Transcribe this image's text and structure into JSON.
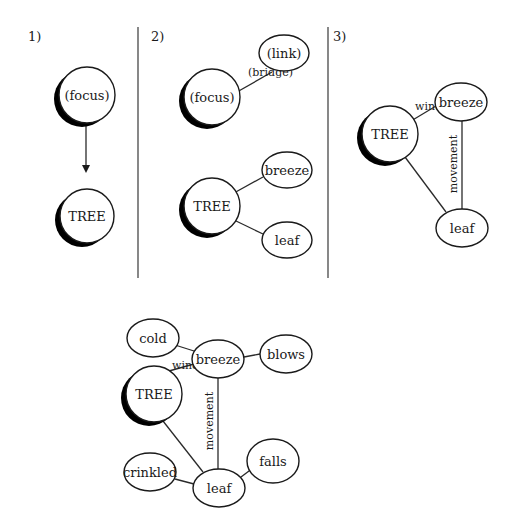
{
  "colors": {
    "background": "#ffffff",
    "stroke": "#1a1a1a",
    "shadow": "#000000",
    "divider": "#555555"
  },
  "panels": [
    {
      "id": "panel-1",
      "label": "1)",
      "x": 28,
      "y": 41
    },
    {
      "id": "panel-2",
      "label": "2)",
      "x": 151,
      "y": 41
    },
    {
      "id": "panel-3",
      "label": "3)",
      "x": 333,
      "y": 41
    }
  ],
  "dividers": [
    {
      "id": "divider-1",
      "x1": 138,
      "y1": 27,
      "x2": 138,
      "y2": 278
    },
    {
      "id": "divider-2",
      "x1": 328,
      "y1": 27,
      "x2": 328,
      "y2": 278
    }
  ],
  "arrows": [
    {
      "id": "focus-to-tree-arrow",
      "x1": 86,
      "y1": 122,
      "x2": 86,
      "y2": 173
    }
  ],
  "nodes": [
    {
      "id": "p1-focus",
      "label": "(focus)",
      "shape": "circle",
      "focal": true,
      "cx": 87,
      "cy": 95,
      "r": 28
    },
    {
      "id": "p1-tree",
      "label": "TREE",
      "shape": "circle",
      "focal": true,
      "cx": 87,
      "cy": 216,
      "r": 27
    },
    {
      "id": "p2-focus",
      "label": "(focus)",
      "shape": "circle",
      "focal": true,
      "cx": 212,
      "cy": 97,
      "r": 28
    },
    {
      "id": "p2-link",
      "label": "(link)",
      "shape": "ellipse",
      "focal": false,
      "cx": 284,
      "cy": 53,
      "rx": 25,
      "ry": 18
    },
    {
      "id": "p2-tree",
      "label": "TREE",
      "shape": "circle",
      "focal": true,
      "cx": 212,
      "cy": 206,
      "r": 28
    },
    {
      "id": "p2-breeze",
      "label": "breeze",
      "shape": "ellipse",
      "focal": false,
      "cx": 287,
      "cy": 170,
      "rx": 25,
      "ry": 18
    },
    {
      "id": "p2-leaf",
      "label": "leaf",
      "shape": "ellipse",
      "focal": false,
      "cx": 287,
      "cy": 240,
      "rx": 25,
      "ry": 18
    },
    {
      "id": "p3-tree",
      "label": "TREE",
      "shape": "circle",
      "focal": true,
      "cx": 390,
      "cy": 134,
      "r": 28
    },
    {
      "id": "p3-breeze",
      "label": "breeze",
      "shape": "ellipse",
      "focal": false,
      "cx": 461,
      "cy": 102,
      "rx": 26,
      "ry": 19
    },
    {
      "id": "p3-leaf",
      "label": "leaf",
      "shape": "ellipse",
      "focal": false,
      "cx": 462,
      "cy": 228,
      "rx": 26,
      "ry": 19
    },
    {
      "id": "p4-cold",
      "label": "cold",
      "shape": "ellipse",
      "focal": false,
      "cx": 153,
      "cy": 338,
      "rx": 26,
      "ry": 19
    },
    {
      "id": "p4-breeze",
      "label": "breeze",
      "shape": "ellipse",
      "focal": false,
      "cx": 218,
      "cy": 359,
      "rx": 26,
      "ry": 19
    },
    {
      "id": "p4-blows",
      "label": "blows",
      "shape": "ellipse",
      "focal": false,
      "cx": 286,
      "cy": 354,
      "rx": 26,
      "ry": 19
    },
    {
      "id": "p4-tree",
      "label": "TREE",
      "shape": "circle",
      "focal": true,
      "cx": 154,
      "cy": 394,
      "r": 28
    },
    {
      "id": "p4-crinkled",
      "label": "crinkled",
      "shape": "ellipse",
      "focal": false,
      "cx": 150,
      "cy": 472,
      "rx": 26,
      "ry": 19
    },
    {
      "id": "p4-leaf",
      "label": "leaf",
      "shape": "ellipse",
      "focal": false,
      "cx": 219,
      "cy": 488,
      "rx": 26,
      "ry": 19
    },
    {
      "id": "p4-falls",
      "label": "falls",
      "shape": "ellipse",
      "focal": false,
      "cx": 273,
      "cy": 461,
      "rx": 26,
      "ry": 22
    }
  ],
  "edges": [
    {
      "id": "p2-bridge-edge",
      "from": "p2-focus",
      "to": "p2-link",
      "x1": 237,
      "y1": 92,
      "x2": 272,
      "y2": 72,
      "label": "(bridge)",
      "lx": 248,
      "ly": 76,
      "rotate": 0
    },
    {
      "id": "p2-tree-breeze-edge",
      "from": "p2-tree",
      "to": "p2-breeze",
      "x1": 234,
      "y1": 193,
      "x2": 263,
      "y2": 177,
      "label": "",
      "lx": 0,
      "ly": 0,
      "rotate": 0
    },
    {
      "id": "p2-tree-leaf-edge",
      "from": "p2-tree",
      "to": "p2-leaf",
      "x1": 234,
      "y1": 220,
      "x2": 263,
      "y2": 234,
      "label": "",
      "lx": 0,
      "ly": 0,
      "rotate": 0
    },
    {
      "id": "p3-wind-edge",
      "from": "p3-tree",
      "to": "p3-breeze",
      "x1": 411,
      "y1": 121,
      "x2": 436,
      "y2": 106,
      "label": "wind",
      "lx": 415,
      "ly": 110,
      "rotate": 0
    },
    {
      "id": "p3-movement-edge",
      "from": "p3-breeze",
      "to": "p3-leaf",
      "x1": 462,
      "y1": 121,
      "x2": 462,
      "y2": 209,
      "label": "movement",
      "lx": 457,
      "ly": 164,
      "rotate": -90
    },
    {
      "id": "p3-tree-leaf-edge",
      "from": "p3-tree",
      "to": "p3-leaf",
      "x1": 405,
      "y1": 157,
      "x2": 446,
      "y2": 212,
      "label": "",
      "lx": 0,
      "ly": 0,
      "rotate": 0
    },
    {
      "id": "p4-cold-breeze-edge",
      "from": "p4-cold",
      "to": "p4-breeze",
      "x1": 175,
      "y1": 345,
      "x2": 194,
      "y2": 351,
      "label": "",
      "lx": 0,
      "ly": 0,
      "rotate": 0
    },
    {
      "id": "p4-breeze-blows-edge",
      "from": "p4-breeze",
      "to": "p4-blows",
      "x1": 244,
      "y1": 357,
      "x2": 260,
      "y2": 354,
      "label": "",
      "lx": 0,
      "ly": 0,
      "rotate": 0
    },
    {
      "id": "p4-wind-edge",
      "from": "p4-tree",
      "to": "p4-breeze",
      "x1": 169,
      "y1": 371,
      "x2": 194,
      "y2": 364,
      "label": "wind",
      "lx": 172,
      "ly": 369,
      "rotate": 0
    },
    {
      "id": "p4-movement-edge",
      "from": "p4-breeze",
      "to": "p4-leaf",
      "x1": 218,
      "y1": 378,
      "x2": 218,
      "y2": 469,
      "label": "movement",
      "lx": 213,
      "ly": 421,
      "rotate": -90
    },
    {
      "id": "p4-tree-leaf-edge",
      "from": "p4-tree",
      "to": "p4-leaf",
      "x1": 163,
      "y1": 421,
      "x2": 203,
      "y2": 472,
      "label": "",
      "lx": 0,
      "ly": 0,
      "rotate": 0
    },
    {
      "id": "p4-crinkled-leaf-edge",
      "from": "p4-crinkled",
      "to": "p4-leaf",
      "x1": 175,
      "y1": 479,
      "x2": 194,
      "y2": 484,
      "label": "",
      "lx": 0,
      "ly": 0,
      "rotate": 0
    },
    {
      "id": "p4-leaf-falls-edge",
      "from": "p4-leaf",
      "to": "p4-falls",
      "x1": 241,
      "y1": 477,
      "x2": 253,
      "y2": 468,
      "label": "",
      "lx": 0,
      "ly": 0,
      "rotate": 0
    }
  ],
  "shadow_offset": {
    "dx": -5,
    "dy": 4
  }
}
